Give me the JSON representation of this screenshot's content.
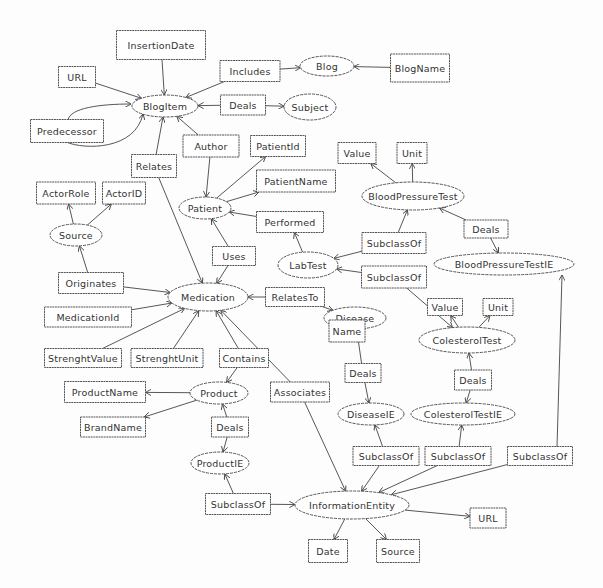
{
  "diagram": {
    "type": "ontology-graph",
    "nodes": [
      {
        "id": "insertion-date",
        "label": "InsertionDate",
        "shape": "rect"
      },
      {
        "id": "url-blog",
        "label": "URL",
        "shape": "rect"
      },
      {
        "id": "blogitem",
        "label": "BlogItem",
        "shape": "ellipse"
      },
      {
        "id": "includes",
        "label": "Includes",
        "shape": "rect"
      },
      {
        "id": "deals-blog",
        "label": "Deals",
        "shape": "rect"
      },
      {
        "id": "blog",
        "label": "Blog",
        "shape": "ellipse"
      },
      {
        "id": "blogname",
        "label": "BlogName",
        "shape": "rect"
      },
      {
        "id": "subject",
        "label": "Subject",
        "shape": "ellipse"
      },
      {
        "id": "predecessor",
        "label": "Predecessor",
        "shape": "rect"
      },
      {
        "id": "author",
        "label": "Author",
        "shape": "rect"
      },
      {
        "id": "patientid",
        "label": "PatientId",
        "shape": "rect"
      },
      {
        "id": "relates",
        "label": "Relates",
        "shape": "rect"
      },
      {
        "id": "patientname",
        "label": "PatientName",
        "shape": "rect"
      },
      {
        "id": "value-bp",
        "label": "Value",
        "shape": "rect"
      },
      {
        "id": "unit-bp",
        "label": "Unit",
        "shape": "rect"
      },
      {
        "id": "bloodpressuretest",
        "label": "BloodPressureTest",
        "shape": "ellipse"
      },
      {
        "id": "actorrole",
        "label": "ActorRole",
        "shape": "rect"
      },
      {
        "id": "actorid",
        "label": "ActorID",
        "shape": "rect"
      },
      {
        "id": "patient",
        "label": "Patient",
        "shape": "ellipse"
      },
      {
        "id": "performed",
        "label": "Performed",
        "shape": "rect"
      },
      {
        "id": "subclassof-bp",
        "label": "SubclassOf",
        "shape": "rect"
      },
      {
        "id": "deals-bp",
        "label": "Deals",
        "shape": "rect"
      },
      {
        "id": "bloodpressuretestie",
        "label": "BloodPressureTestIE",
        "shape": "ellipse"
      },
      {
        "id": "source-actor",
        "label": "Source",
        "shape": "ellipse"
      },
      {
        "id": "labtest",
        "label": "LabTest",
        "shape": "ellipse"
      },
      {
        "id": "subclassof-col",
        "label": "SubclassOf",
        "shape": "rect"
      },
      {
        "id": "uses",
        "label": "Uses",
        "shape": "rect"
      },
      {
        "id": "originates",
        "label": "Originates",
        "shape": "rect"
      },
      {
        "id": "medication",
        "label": "Medication",
        "shape": "ellipse"
      },
      {
        "id": "relatesto",
        "label": "RelatesTo",
        "shape": "rect"
      },
      {
        "id": "disease",
        "label": "Disease",
        "shape": "ellipse"
      },
      {
        "id": "medicationid",
        "label": "MedicationId",
        "shape": "rect"
      },
      {
        "id": "name",
        "label": "Name",
        "shape": "rect"
      },
      {
        "id": "value-col",
        "label": "Value",
        "shape": "rect"
      },
      {
        "id": "unit-col",
        "label": "Unit",
        "shape": "rect"
      },
      {
        "id": "colesteroltest",
        "label": "ColesterolTest",
        "shape": "ellipse"
      },
      {
        "id": "strenghtvalue",
        "label": "StrenghtValue",
        "shape": "rect"
      },
      {
        "id": "strenghtunit",
        "label": "StrenghtUnit",
        "shape": "rect"
      },
      {
        "id": "contains",
        "label": "Contains",
        "shape": "rect"
      },
      {
        "id": "deals-disease",
        "label": "Deals",
        "shape": "rect"
      },
      {
        "id": "deals-col",
        "label": "Deals",
        "shape": "rect"
      },
      {
        "id": "productname",
        "label": "ProductName",
        "shape": "rect"
      },
      {
        "id": "product",
        "label": "Product",
        "shape": "ellipse"
      },
      {
        "id": "associates",
        "label": "Associates",
        "shape": "rect"
      },
      {
        "id": "diseaseie",
        "label": "DiseaseIE",
        "shape": "ellipse"
      },
      {
        "id": "colesteroltestie",
        "label": "ColesterolTestIE",
        "shape": "ellipse"
      },
      {
        "id": "brandname",
        "label": "BrandName",
        "shape": "rect"
      },
      {
        "id": "deals-product",
        "label": "Deals",
        "shape": "rect"
      },
      {
        "id": "subclassof-diseaseie",
        "label": "SubclassOf",
        "shape": "rect"
      },
      {
        "id": "subclassof-colie",
        "label": "SubclassOf",
        "shape": "rect"
      },
      {
        "id": "subclassof-bpie",
        "label": "SubclassOf",
        "shape": "rect"
      },
      {
        "id": "productie",
        "label": "ProductIE",
        "shape": "ellipse"
      },
      {
        "id": "subclassof-productie",
        "label": "SubclassOf",
        "shape": "rect"
      },
      {
        "id": "informationentity",
        "label": "InformationEntity",
        "shape": "ellipse"
      },
      {
        "id": "url-ie",
        "label": "URL",
        "shape": "rect"
      },
      {
        "id": "date",
        "label": "Date",
        "shape": "rect"
      },
      {
        "id": "source-ie",
        "label": "Source",
        "shape": "rect"
      }
    ],
    "edges": [
      {
        "from": "insertion-date",
        "to": "blogitem"
      },
      {
        "from": "url-blog",
        "to": "blogitem"
      },
      {
        "from": "includes",
        "to": "blogitem"
      },
      {
        "from": "includes",
        "to": "blog"
      },
      {
        "from": "blogname",
        "to": "blog"
      },
      {
        "from": "deals-blog",
        "to": "blogitem"
      },
      {
        "from": "deals-blog",
        "to": "subject"
      },
      {
        "from": "predecessor",
        "to": "blogitem"
      },
      {
        "from": "predecessor",
        "to": "blogitem"
      },
      {
        "from": "author",
        "to": "blogitem"
      },
      {
        "from": "author",
        "to": "patient"
      },
      {
        "from": "relates",
        "to": "blogitem"
      },
      {
        "from": "relates",
        "to": "medication"
      },
      {
        "from": "patient",
        "to": "patientid"
      },
      {
        "from": "patient",
        "to": "patientname"
      },
      {
        "from": "performed",
        "to": "patient"
      },
      {
        "from": "labtest",
        "to": "performed"
      },
      {
        "from": "bloodpressuretest",
        "to": "value-bp"
      },
      {
        "from": "bloodpressuretest",
        "to": "unit-bp"
      },
      {
        "from": "subclassof-bp",
        "to": "bloodpressuretest"
      },
      {
        "from": "subclassof-bp",
        "to": "labtest"
      },
      {
        "from": "subclassof-col",
        "to": "labtest"
      },
      {
        "from": "subclassof-col",
        "to": "colesteroltest"
      },
      {
        "from": "deals-bp",
        "to": "bloodpressuretest"
      },
      {
        "from": "deals-bp",
        "to": "bloodpressuretestie"
      },
      {
        "from": "source-actor",
        "to": "actorrole"
      },
      {
        "from": "source-actor",
        "to": "actorid"
      },
      {
        "from": "originates",
        "to": "source-actor"
      },
      {
        "from": "originates",
        "to": "medication"
      },
      {
        "from": "uses",
        "to": "patient"
      },
      {
        "from": "uses",
        "to": "medication"
      },
      {
        "from": "relatesto",
        "to": "medication"
      },
      {
        "from": "relatesto",
        "to": "disease"
      },
      {
        "from": "disease",
        "to": "name"
      },
      {
        "from": "medicationid",
        "to": "medication"
      },
      {
        "from": "strenghtvalue",
        "to": "medication"
      },
      {
        "from": "strenghtunit",
        "to": "medication"
      },
      {
        "from": "contains",
        "to": "medication"
      },
      {
        "from": "contains",
        "to": "product"
      },
      {
        "from": "colesteroltest",
        "to": "value-col"
      },
      {
        "from": "colesteroltest",
        "to": "unit-col"
      },
      {
        "from": "deals-disease",
        "to": "disease"
      },
      {
        "from": "deals-disease",
        "to": "diseaseie"
      },
      {
        "from": "deals-col",
        "to": "colesteroltest"
      },
      {
        "from": "deals-col",
        "to": "colesteroltestie"
      },
      {
        "from": "product",
        "to": "productname"
      },
      {
        "from": "product",
        "to": "brandname"
      },
      {
        "from": "deals-product",
        "to": "product"
      },
      {
        "from": "deals-product",
        "to": "productie"
      },
      {
        "from": "associates",
        "to": "medication"
      },
      {
        "from": "associates",
        "to": "informationentity"
      },
      {
        "from": "subclassof-diseaseie",
        "to": "diseaseie"
      },
      {
        "from": "subclassof-diseaseie",
        "to": "informationentity"
      },
      {
        "from": "subclassof-colie",
        "to": "colesteroltestie"
      },
      {
        "from": "subclassof-colie",
        "to": "informationentity"
      },
      {
        "from": "subclassof-bpie",
        "to": "bloodpressuretestie"
      },
      {
        "from": "subclassof-bpie",
        "to": "informationentity"
      },
      {
        "from": "subclassof-productie",
        "to": "productie"
      },
      {
        "from": "subclassof-productie",
        "to": "informationentity"
      },
      {
        "from": "informationentity",
        "to": "url-ie"
      },
      {
        "from": "informationentity",
        "to": "date"
      },
      {
        "from": "informationentity",
        "to": "source-ie"
      }
    ]
  }
}
